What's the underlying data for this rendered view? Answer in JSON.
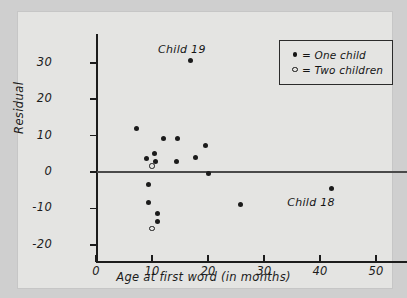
{
  "chart_data": {
    "type": "scatter",
    "title": "",
    "xlabel": "Age at first word (in months)",
    "ylabel": "Residual",
    "xlim": [
      0,
      55.5
    ],
    "ylim": [
      -22,
      36
    ],
    "xticks": [
      0,
      10,
      20,
      30,
      40,
      50
    ],
    "yticks": [
      30,
      20,
      10,
      0,
      -10,
      -20
    ],
    "xtick_labels": [
      "0",
      "10",
      "20",
      "30",
      "40",
      "50"
    ],
    "ytick_labels": [
      "30",
      "20",
      "10",
      "0",
      "-10",
      "-20"
    ],
    "grid": false,
    "reference_line": {
      "orientation": "horizontal",
      "y": 0
    },
    "legend": {
      "position": "top-right",
      "entries": [
        {
          "marker": "filled-dot",
          "symbol": "•",
          "label": "= One child"
        },
        {
          "marker": "open-circle",
          "symbol": "◦",
          "label": "= Two children"
        }
      ]
    },
    "series": [
      {
        "name": "One child",
        "marker": "filled-dot",
        "points": [
          {
            "x": 7.3,
            "y": 12.0
          },
          {
            "x": 9.0,
            "y": 3.6
          },
          {
            "x": 9.3,
            "y": -3.3
          },
          {
            "x": 9.3,
            "y": -8.4
          },
          {
            "x": 10.4,
            "y": 5.0
          },
          {
            "x": 10.6,
            "y": 2.9
          },
          {
            "x": 11.0,
            "y": -11.5
          },
          {
            "x": 11.0,
            "y": -13.5
          },
          {
            "x": 12.0,
            "y": 9.3
          },
          {
            "x": 14.6,
            "y": 9.3
          },
          {
            "x": 14.4,
            "y": 2.8
          },
          {
            "x": 16.8,
            "y": 30.6
          },
          {
            "x": 17.7,
            "y": 4.0
          },
          {
            "x": 19.6,
            "y": 7.2
          },
          {
            "x": 20.0,
            "y": -0.3
          },
          {
            "x": 25.8,
            "y": -8.9
          },
          {
            "x": 42.0,
            "y": -4.5
          }
        ]
      },
      {
        "name": "Two children",
        "marker": "open-circle",
        "points": [
          {
            "x": 10.0,
            "y": 1.7
          },
          {
            "x": 10.0,
            "y": -15.5
          }
        ]
      }
    ],
    "annotations": [
      {
        "text": "Child 19",
        "x": 16.8,
        "y": 30.6,
        "position": "above"
      },
      {
        "text": "Child 18",
        "x": 42.0,
        "y": -4.5,
        "position": "below-left"
      }
    ]
  }
}
